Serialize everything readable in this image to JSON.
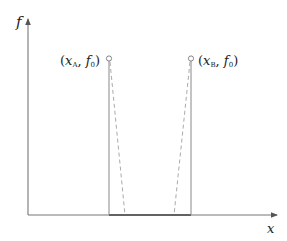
{
  "diagram": {
    "axes": {
      "y_label": "f",
      "x_label": "x"
    },
    "points": [
      {
        "name": "A",
        "label_open": "(",
        "var": "x",
        "sub": "A",
        "sep": ", ",
        "var2": "f",
        "sub2": "0",
        "label_close": ")"
      },
      {
        "name": "B",
        "label_open": "(",
        "var": "x",
        "sub": "B",
        "sep": ", ",
        "var2": "f",
        "sub2": "0",
        "label_close": ")"
      }
    ],
    "colors": {
      "axis": "#666666",
      "solid_line": "#888888",
      "dashed_line": "#aaaaaa",
      "marker_stroke": "#777777",
      "base_segment": "#444444"
    }
  }
}
